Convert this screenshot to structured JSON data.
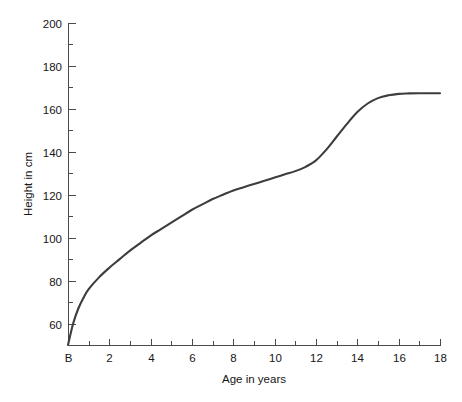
{
  "chart_data": {
    "type": "line",
    "title": "",
    "xlabel": "Age in years",
    "ylabel": "Height in cm",
    "xlim": [
      0,
      18
    ],
    "ylim": [
      50,
      200
    ],
    "grid": false,
    "legend": null,
    "x_tick_labels": [
      "B",
      "2",
      "4",
      "6",
      "8",
      "10",
      "12",
      "14",
      "16",
      "18"
    ],
    "x_tick_values": [
      0,
      2,
      4,
      6,
      8,
      10,
      12,
      14,
      16,
      18
    ],
    "x_minor_tick_values": [
      1,
      3,
      5,
      7,
      9,
      11,
      13,
      15,
      17
    ],
    "y_tick_labels": [
      "60",
      "80",
      "100",
      "120",
      "140",
      "160",
      "180",
      "200"
    ],
    "y_tick_values": [
      60,
      80,
      100,
      120,
      140,
      160,
      180,
      200
    ],
    "y_minor_tick_values": [
      50,
      70,
      90,
      110,
      130,
      150,
      170,
      190
    ],
    "series": [
      {
        "name": "Height",
        "x": [
          0,
          0.25,
          0.5,
          0.75,
          1,
          1.5,
          2,
          2.5,
          3,
          3.5,
          4,
          4.5,
          5,
          5.5,
          6,
          6.5,
          7,
          7.5,
          8,
          8.5,
          9,
          9.5,
          10,
          10.5,
          11,
          11.5,
          12,
          12.5,
          13,
          13.5,
          14,
          14.5,
          15,
          15.5,
          16,
          16.5,
          17,
          17.5,
          18
        ],
        "y": [
          50,
          60,
          67,
          72,
          76,
          81.5,
          86,
          90,
          94,
          97.5,
          101,
          104,
          107,
          110,
          113,
          115.5,
          118,
          120,
          122,
          123.5,
          125,
          126.5,
          128,
          129.5,
          131,
          133,
          136,
          141,
          147,
          153,
          158.5,
          162.5,
          165,
          166.3,
          167,
          167.2,
          167.3,
          167.3,
          167.3
        ]
      }
    ],
    "curve_color": "#3d3d3d",
    "axis_color": "#4a4a4a",
    "background_color": "#ffffff"
  },
  "layout": {
    "plot_left": 68,
    "plot_right": 440,
    "plot_top": 23,
    "plot_bottom": 345,
    "width": 462,
    "height": 402
  }
}
